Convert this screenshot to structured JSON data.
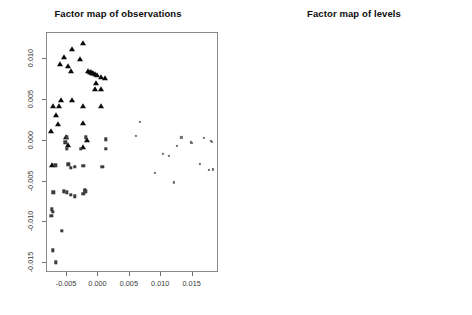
{
  "figure": {
    "width": 472,
    "height": 315,
    "background": "#ffffff",
    "panels": 2
  },
  "chart_data": [
    {
      "type": "scatter",
      "panel": "left",
      "title": "Factor map of observations",
      "xlabel": "",
      "ylabel": "",
      "xlim": [
        -0.0082,
        0.0192
      ],
      "ylim": [
        -0.0162,
        0.0132
      ],
      "xticks": [
        -0.005,
        0.0,
        0.005,
        0.01,
        0.015
      ],
      "xticklabels": [
        "-0.005",
        "0.000",
        "0.005",
        "0.010",
        "0.015"
      ],
      "yticks": [
        0.01,
        0.005,
        0.0,
        -0.005,
        -0.01,
        -0.015
      ],
      "yticklabels": [
        "0.010",
        "0.005",
        "0.000",
        "-0.005",
        "-0.010",
        "-0.015"
      ],
      "grid": false,
      "legend": false,
      "series": [
        {
          "name": "group-triangle",
          "marker": "triangle",
          "color": "#0a0a0a",
          "points": [
            [
              -0.0025,
              0.012
            ],
            [
              -0.0042,
              0.0113
            ],
            [
              -0.0055,
              0.0102
            ],
            [
              -0.0029,
              0.01
            ],
            [
              -0.0062,
              0.0094
            ],
            [
              -0.0048,
              0.0092
            ],
            [
              -0.0043,
              0.0086
            ],
            [
              -0.0016,
              0.0085
            ],
            [
              -0.0014,
              0.0084
            ],
            [
              -0.0012,
              0.0084
            ],
            [
              -0.001,
              0.0083
            ],
            [
              -0.0008,
              0.0083
            ],
            [
              -0.0006,
              0.0082
            ],
            [
              -0.0003,
              0.008
            ],
            [
              0.0004,
              0.0078
            ],
            [
              0.001,
              0.0077
            ],
            [
              -0.0004,
              0.0071
            ],
            [
              -0.0005,
              0.0064
            ],
            [
              0.0004,
              0.0063
            ],
            [
              -0.006,
              0.005
            ],
            [
              -0.0042,
              0.005
            ],
            [
              -0.0072,
              0.0043
            ],
            [
              -0.0063,
              0.0043
            ],
            [
              -0.0024,
              0.0043
            ],
            [
              0.0004,
              0.0042
            ],
            [
              -0.0068,
              0.0031
            ],
            [
              -0.0064,
              0.0021
            ],
            [
              -0.0024,
              0.0022
            ],
            [
              -0.0076,
              0.0012
            ],
            [
              -0.0051,
              0.0004
            ],
            [
              -0.0049,
              -0.0005
            ],
            [
              -0.0024,
              -0.0008
            ],
            [
              -0.0018,
              5e-05
            ],
            [
              -0.0074,
              -0.003
            ]
          ]
        },
        {
          "name": "group-square",
          "marker": "square",
          "color": "#3a3a3a",
          "points": [
            [
              -0.005,
              0.0004
            ],
            [
              -0.002,
              0.0004
            ],
            [
              0.0012,
              0.0002
            ],
            [
              -0.0053,
              -0.0002
            ],
            [
              -0.005,
              -0.001
            ],
            [
              -0.0028,
              -0.001
            ],
            [
              0.0012,
              -0.001
            ],
            [
              -0.0048,
              -0.0029
            ],
            [
              -0.0044,
              -0.0033
            ],
            [
              -0.0038,
              -0.0032
            ],
            [
              -0.0024,
              -0.0031
            ],
            [
              0.0006,
              -0.0032
            ],
            [
              -0.0069,
              -0.003
            ],
            [
              -0.0072,
              -0.0063
            ],
            [
              -0.0055,
              -0.0062
            ],
            [
              -0.005,
              -0.0063
            ],
            [
              -0.0044,
              -0.0066
            ],
            [
              -0.0038,
              -0.0068
            ],
            [
              -0.0022,
              -0.006
            ],
            [
              -0.0021,
              -0.0062
            ],
            [
              -0.0024,
              -0.0065
            ],
            [
              -0.0074,
              -0.0084
            ],
            [
              -0.0073,
              -0.0087
            ],
            [
              -0.0075,
              -0.0092
            ],
            [
              -0.0058,
              -0.011
            ],
            [
              -0.0073,
              -0.0134
            ],
            [
              -0.0068,
              -0.0149
            ]
          ]
        },
        {
          "name": "group-dot",
          "marker": "dot",
          "color": "#6f6f6f",
          "points": [
            [
              0.0066,
              0.0023
            ],
            [
              0.006,
              0.0006
            ],
            [
              0.0132,
              0.0004
            ],
            [
              0.0168,
              0.0003
            ],
            [
              0.0179,
              -5e-05
            ],
            [
              0.0181,
              -0.00015
            ],
            [
              0.0125,
              -0.0006
            ],
            [
              0.0103,
              -0.0016
            ],
            [
              0.0112,
              -0.0019
            ],
            [
              0.0147,
              -0.0002
            ],
            [
              0.0149,
              -0.0003
            ],
            [
              0.0162,
              -0.0028
            ],
            [
              0.009,
              -0.0039
            ],
            [
              0.0176,
              -0.0036
            ],
            [
              0.0182,
              -0.0035
            ],
            [
              0.012,
              -0.0051
            ]
          ]
        }
      ]
    },
    {
      "type": "scatter",
      "panel": "right",
      "title": "Factor map of levels",
      "xlabel": "",
      "ylabel": "",
      "xlim": [
        -0.0158,
        0.0382
      ],
      "ylim": [
        -0.0342,
        0.0335
      ],
      "xticks": [
        -0.01,
        0.0,
        0.01,
        0.02,
        0.03
      ],
      "xticklabels": [
        "-0.01",
        "0.00",
        "0.01",
        "0.02",
        "0.03"
      ],
      "yticks": [
        0.03,
        0.02,
        0.01,
        0.0,
        -0.01,
        -0.02,
        -0.03
      ],
      "yticklabels": [
        "0.03",
        "0.02",
        "0.01",
        "0.00",
        "-0.01",
        "-0.02",
        "-0.03"
      ],
      "grid": false,
      "legend": false,
      "labels": [
        {
          "text": "First-time buyers",
          "x": -0.0095,
          "y": 0.0303
        },
        {
          "text": "Child_4",
          "x": -0.0072,
          "y": 0.0292
        },
        {
          "text": "Child_2",
          "x": -0.004,
          "y": 0.0255
        },
        {
          "text": "Senior management",
          "x": -0.011,
          "y": 0.0233
        },
        {
          "text": "50",
          "x": 0.0018,
          "y": 0.0172
        },
        {
          "text": "Married",
          "x": 0.0031,
          "y": 0.0163
        },
        {
          "text": "Child_3",
          "x": -0.0087,
          "y": 0.0126
        },
        {
          "text": "Debt_4",
          "x": -0.0106,
          "y": 0.0113
        },
        {
          "text": "Mortgage",
          "x": -0.0048,
          "y": 0.0113
        },
        {
          "text": "Child_1",
          "x": -0.003,
          "y": 0.0112
        },
        {
          "text": "DI",
          "x": -0.0063,
          "y": 0.0095
        },
        {
          "text": "Une_1",
          "x": -0.003,
          "y": 0.0082
        },
        {
          "text": "Debt_3",
          "x": -0.0038,
          "y": 0.0073
        },
        {
          "text": "ins_2",
          "x": -0.0008,
          "y": 0.008
        },
        {
          "text": "Management",
          "x": -0.0044,
          "y": 0.0047
        },
        {
          "text": "Home owner",
          "x": 0.0144,
          "y": 0.0046
        },
        {
          "text": "Degree",
          "x": -0.0029,
          "y": 0.003
        },
        {
          "text": "Emp_0",
          "x": -0.0012,
          "y": 0.0032
        },
        {
          "text": "Technician",
          "x": -0.0092,
          "y": 0.0016
        },
        {
          "text": "WP",
          "x": -0.0025,
          "y": 0.0022
        },
        {
          "text": "CSP_D",
          "x": -0.0077,
          "y": 0.001
        },
        {
          "text": "Renovation",
          "x": 0.0193,
          "y": 0.0008
        },
        {
          "text": "30",
          "x": -0.0072,
          "y": -0.0007
        },
        {
          "text": "No insurance",
          "x": 0.0052,
          "y": -0.0006
        },
        {
          "text": "Widow",
          "x": 0.0088,
          "y": -0.0007
        },
        {
          "text": "Lender",
          "x": -0.0152,
          "y": -0.0015
        },
        {
          "text": "no_deposit",
          "x": -0.0028,
          "y": -0.0035
        },
        {
          "text": "Common-law",
          "x": -0.0102,
          "y": -0.0068
        },
        {
          "text": "Widower",
          "x": 0.029,
          "y": -0.007
        },
        {
          "text": "Tenant",
          "x": -0.0094,
          "y": -0.0087
        },
        {
          "text": "Furnishings",
          "x": -0.006,
          "y": -0.0084
        },
        {
          "text": "Debt_1",
          "x": -0.0042,
          "y": -0.0098
        },
        {
          "text": "Debt_2",
          "x": 0.012,
          "y": -0.0097
        },
        {
          "text": "Sale",
          "x": 0.0322,
          "y": -0.009
        },
        {
          "text": "Single",
          "x": -0.0064,
          "y": -0.0138
        },
        {
          "text": "Divorced",
          "x": -0.0016,
          "y": -0.0136
        },
        {
          "text": "Child_0",
          "x": 0.0008,
          "y": -0.0138
        },
        {
          "text": "20",
          "x": -0.0121,
          "y": -0.016
        },
        {
          "text": "Legal",
          "x": -0.014,
          "y": -0.0173
        },
        {
          "text": "No diploma",
          "x": -0.0095,
          "y": -0.0174
        },
        {
          "text": "No_employer",
          "x": -0.0054,
          "y": -0.0174
        },
        {
          "text": "Higher education",
          "x": -0.0148,
          "y": -0.0201
        },
        {
          "text": "with the family",
          "x": -0.0086,
          "y": -0.02
        },
        {
          "text": "Science",
          "x": -0.0035,
          "y": -0.0212
        },
        {
          "text": "Manual Labourer",
          "x": -0.0086,
          "y": -0.0228
        },
        {
          "text": "Miss",
          "x": -0.0133,
          "y": -0.0318
        }
      ]
    }
  ]
}
